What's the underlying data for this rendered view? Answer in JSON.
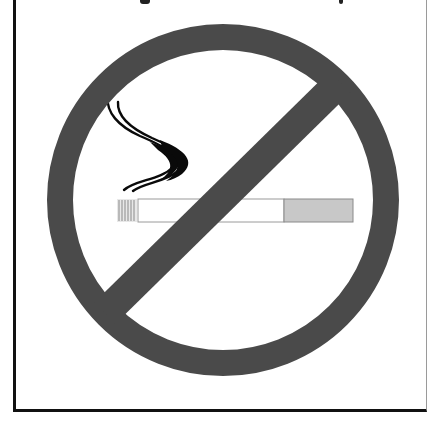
{
  "sign": {
    "type": "no-smoking",
    "label": "No smoking prohibition sign",
    "colors": {
      "ring": "#4a4a4a",
      "slash": "#4a4a4a",
      "background": "#ffffff",
      "smoke": "#0a0a0a",
      "cigarette_body": "#ffffff",
      "cigarette_outline": "#9a9a9a",
      "filter": "#c8c8c8",
      "ash": "#8a8a8a",
      "frame": "#111111"
    },
    "ring": {
      "cx": 223,
      "cy": 200,
      "r_outer": 176,
      "thickness": 26
    },
    "slash": {
      "x1": 335,
      "y1": 87,
      "x2": 110,
      "y2": 308,
      "width": 30
    },
    "cigarette": {
      "x": 117,
      "y": 199,
      "height": 23,
      "ash_width": 20,
      "body_width": 146,
      "filter_width": 70
    }
  },
  "header_text": {
    "visible": "partially cropped at top edge",
    "content": ""
  }
}
